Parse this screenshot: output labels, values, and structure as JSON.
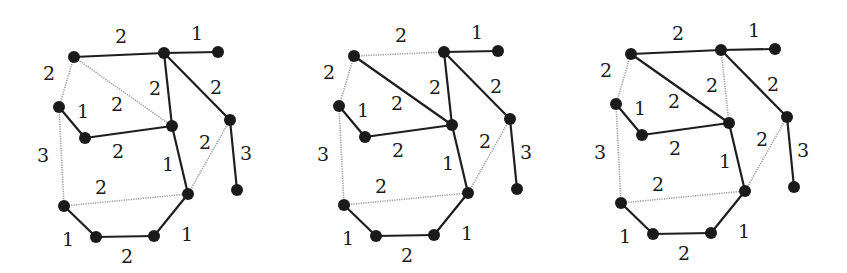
{
  "figure": {
    "colors": {
      "tree_edge": "#1e1e1e",
      "non_tree_edge": "#9a9a9a",
      "node": "#1a1a1a",
      "background": "#ffffff"
    },
    "node_radius": 6,
    "nodes": {
      "A": [
        74,
        57
      ],
      "B": [
        164,
        53
      ],
      "C": [
        218,
        52
      ],
      "D": [
        59,
        107
      ],
      "E": [
        85,
        138
      ],
      "F": [
        172,
        126
      ],
      "G": [
        230,
        120
      ],
      "H": [
        237,
        190
      ],
      "I": [
        188,
        194
      ],
      "J": [
        64,
        206
      ],
      "K": [
        96,
        237
      ],
      "L": [
        154,
        236
      ]
    },
    "edges": [
      {
        "id": "A-B",
        "from": "A",
        "to": "B",
        "weight": "2",
        "label_pos": [
          121,
          36
        ]
      },
      {
        "id": "B-C",
        "from": "B",
        "to": "C",
        "weight": "1",
        "label_pos": [
          197,
          33
        ]
      },
      {
        "id": "A-D",
        "from": "A",
        "to": "D",
        "weight": "2",
        "label_pos": [
          49,
          73
        ]
      },
      {
        "id": "A-F",
        "from": "A",
        "to": "F",
        "weight": "2",
        "label_pos": [
          117,
          104
        ]
      },
      {
        "id": "B-F",
        "from": "B",
        "to": "F",
        "weight": "2",
        "label_pos": [
          155,
          88
        ]
      },
      {
        "id": "B-G",
        "from": "B",
        "to": "G",
        "weight": "2",
        "label_pos": [
          216,
          87
        ]
      },
      {
        "id": "D-E",
        "from": "D",
        "to": "E",
        "weight": "1",
        "label_pos": [
          83,
          111
        ]
      },
      {
        "id": "E-F",
        "from": "E",
        "to": "F",
        "weight": "2",
        "label_pos": [
          118,
          151
        ]
      },
      {
        "id": "D-J",
        "from": "D",
        "to": "J",
        "weight": "3",
        "label_pos": [
          43,
          155
        ]
      },
      {
        "id": "F-I",
        "from": "F",
        "to": "I",
        "weight": "1",
        "label_pos": [
          168,
          164
        ]
      },
      {
        "id": "G-I",
        "from": "G",
        "to": "I",
        "weight": "2",
        "label_pos": [
          205,
          142
        ]
      },
      {
        "id": "G-H",
        "from": "G",
        "to": "H",
        "weight": "3",
        "label_pos": [
          246,
          153
        ]
      },
      {
        "id": "J-I",
        "from": "J",
        "to": "I",
        "weight": "2",
        "label_pos": [
          101,
          187
        ]
      },
      {
        "id": "J-K",
        "from": "J",
        "to": "K",
        "weight": "1",
        "label_pos": [
          68,
          239
        ]
      },
      {
        "id": "K-L",
        "from": "K",
        "to": "L",
        "weight": "2",
        "label_pos": [
          127,
          256
        ]
      },
      {
        "id": "L-I",
        "from": "L",
        "to": "I",
        "weight": "1",
        "label_pos": [
          187,
          234
        ]
      }
    ],
    "panels": [
      {
        "name": "spanning-tree-1",
        "offset": [
          0,
          0
        ],
        "dotted_edges": [
          "A-D",
          "A-F",
          "D-J",
          "G-I",
          "J-I"
        ]
      },
      {
        "name": "spanning-tree-2",
        "offset": [
          280,
          -1
        ],
        "dotted_edges": [
          "A-B",
          "A-D",
          "D-J",
          "G-I",
          "J-I"
        ]
      },
      {
        "name": "spanning-tree-3",
        "offset": [
          557,
          -3
        ],
        "dotted_edges": [
          "A-D",
          "B-F",
          "D-J",
          "G-I",
          "J-I"
        ]
      }
    ]
  }
}
